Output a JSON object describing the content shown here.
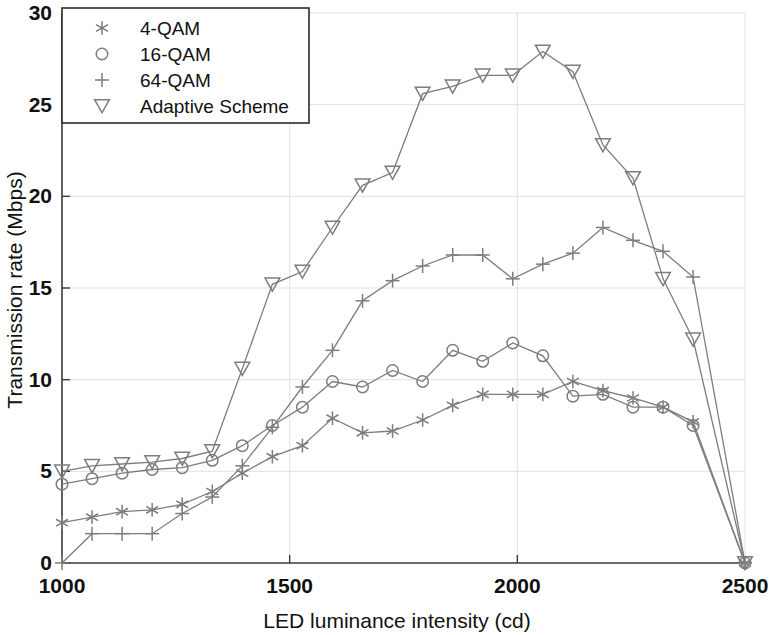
{
  "chart_data": {
    "type": "line",
    "title": "",
    "xlabel": "LED luminance intensity (cd)",
    "ylabel": "Transmission rate (Mbps)",
    "xlim": [
      1000,
      2500
    ],
    "ylim": [
      0,
      30
    ],
    "xticks": [
      1000,
      1500,
      2000,
      2500
    ],
    "yticks": [
      0,
      5,
      10,
      15,
      20,
      25,
      30
    ],
    "xtick_labels": [
      "1000",
      "1500",
      "2000",
      "2500"
    ],
    "ytick_labels": [
      "0",
      "5",
      "10",
      "15",
      "20",
      "25",
      "30"
    ],
    "grid": true,
    "legend_position": "upper-left",
    "series": [
      {
        "name": "4-QAM",
        "marker": "asterisk",
        "color": "#8a8a8a",
        "x": [
          1000,
          1066,
          1132,
          1198,
          1264,
          1330,
          1396,
          1462,
          1528,
          1594,
          1660,
          1726,
          1792,
          1858,
          1924,
          1990,
          2056,
          2122,
          2188,
          2254,
          2320,
          2386,
          2500
        ],
        "y": [
          2.2,
          2.5,
          2.8,
          2.9,
          3.2,
          3.9,
          4.9,
          5.8,
          6.4,
          7.9,
          7.1,
          7.2,
          7.8,
          8.6,
          9.2,
          9.2,
          9.2,
          9.9,
          9.4,
          9.0,
          8.5,
          7.7,
          0.0
        ]
      },
      {
        "name": "16-QAM",
        "marker": "circle",
        "color": "#8a8a8a",
        "x": [
          1000,
          1066,
          1132,
          1198,
          1264,
          1330,
          1396,
          1462,
          1528,
          1594,
          1660,
          1726,
          1792,
          1858,
          1924,
          1990,
          2056,
          2122,
          2188,
          2254,
          2320,
          2386,
          2500
        ],
        "y": [
          4.3,
          4.6,
          4.9,
          5.1,
          5.2,
          5.6,
          6.4,
          7.5,
          8.5,
          9.9,
          9.6,
          10.5,
          9.9,
          11.6,
          11.0,
          12.0,
          11.3,
          9.1,
          9.2,
          8.5,
          8.5,
          7.5,
          0.0
        ]
      },
      {
        "name": "64-QAM",
        "marker": "plus",
        "color": "#8a8a8a",
        "x": [
          1000,
          1066,
          1132,
          1198,
          1264,
          1330,
          1396,
          1462,
          1528,
          1594,
          1660,
          1726,
          1792,
          1858,
          1924,
          1990,
          2056,
          2122,
          2188,
          2254,
          2320,
          2386,
          2500
        ],
        "y": [
          0.0,
          1.6,
          1.6,
          1.6,
          2.7,
          3.6,
          5.3,
          7.4,
          9.6,
          11.6,
          14.3,
          15.4,
          16.2,
          16.8,
          16.8,
          15.5,
          16.3,
          16.9,
          18.3,
          17.6,
          17.0,
          15.6,
          0.0
        ]
      },
      {
        "name": "Adaptive Scheme",
        "marker": "triangle-down",
        "color": "#8a8a8a",
        "x": [
          1000,
          1066,
          1132,
          1198,
          1264,
          1330,
          1396,
          1462,
          1528,
          1594,
          1660,
          1726,
          1792,
          1858,
          1924,
          1990,
          2056,
          2122,
          2188,
          2254,
          2320,
          2386,
          2500
        ],
        "y": [
          5.0,
          5.3,
          5.4,
          5.5,
          5.7,
          6.1,
          10.6,
          15.2,
          15.9,
          18.3,
          20.6,
          21.3,
          25.6,
          26.0,
          26.6,
          26.6,
          27.9,
          26.8,
          22.8,
          21.0,
          15.5,
          12.2,
          0.0
        ]
      }
    ],
    "legend_entries": [
      {
        "label": "4-QAM",
        "marker": "asterisk"
      },
      {
        "label": "16-QAM",
        "marker": "circle"
      },
      {
        "label": "64-QAM",
        "marker": "plus"
      },
      {
        "label": "Adaptive Scheme",
        "marker": "triangle-down"
      }
    ]
  }
}
